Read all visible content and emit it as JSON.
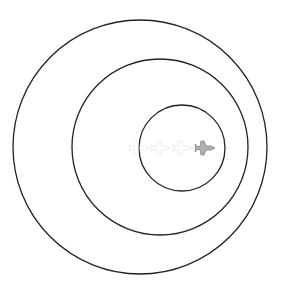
{
  "diagram": {
    "width": 289,
    "height": 300,
    "background": "#ffffff",
    "stroke_color": "#222222",
    "circles": [
      {
        "name": "outer-circle",
        "cx": 140,
        "cy": 147,
        "r": 127
      },
      {
        "name": "middle-circle",
        "cx": 160,
        "cy": 147,
        "r": 88
      },
      {
        "name": "inner-circle",
        "cx": 182,
        "cy": 148,
        "r": 43
      }
    ],
    "jets": [
      {
        "name": "jet-ghost-1",
        "x": 131,
        "y": 148,
        "opacity": 0.25
      },
      {
        "name": "jet-ghost-2",
        "x": 153,
        "y": 148,
        "opacity": 0.3
      },
      {
        "name": "jet-ghost-3",
        "x": 175,
        "y": 148,
        "opacity": 0.35
      },
      {
        "name": "jet-solid",
        "x": 197,
        "y": 148,
        "opacity": 1.0
      }
    ],
    "jet_fill": "#b0b0b0",
    "jet_stroke": "#7a7a7a"
  }
}
